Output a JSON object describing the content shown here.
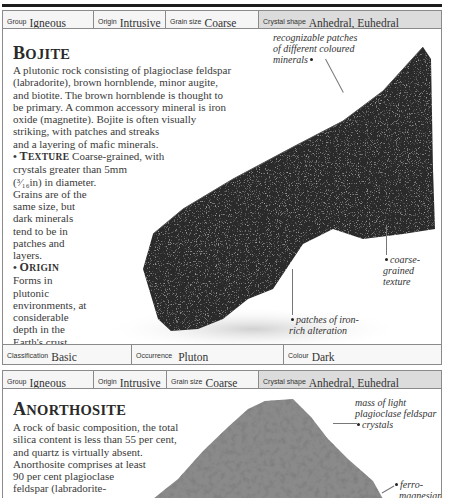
{
  "bojite": {
    "header": {
      "group": {
        "label": "Group",
        "value": "Igneous"
      },
      "origin": {
        "label": "Origin",
        "value": "Intrusive"
      },
      "grain_size": {
        "label": "Grain size",
        "value": "Coarse"
      },
      "crystal_shape": {
        "label": "Crystal shape",
        "value": "Anhedral, Euhedral"
      }
    },
    "title_first": "B",
    "title_rest": "OJITE",
    "description_lines": [
      "A plutonic rock consisting of plagioclase feldspar",
      "(labradorite), brown hornblende, minor augite,",
      "and biotite. The brown hornblende is thought to",
      "be primary. A common accessory mineral is iron",
      "oxide (magnetite). Bojite is often visually",
      "striking, with patches and streaks",
      "and a layering of mafic minerals."
    ],
    "texture": {
      "bullet": "•",
      "heading_first": "T",
      "heading_rest": "EXTURE",
      "lines": [
        "Coarse-grained, with",
        "crystals greater than 5mm",
        "(³⁄₁₆in) in diameter.",
        "Grains are of the",
        "same size, but",
        "dark minerals",
        "tend to be in",
        "patches and",
        "layers."
      ]
    },
    "origin_section": {
      "bullet": "•",
      "heading_first": "O",
      "heading_rest": "RIGIN",
      "lines": [
        "Forms in",
        "plutonic",
        "environments, at",
        "considerable",
        "depth in the",
        "Earth's crust."
      ]
    },
    "annotations": {
      "patches": [
        "recognizable patches",
        "of different coloured",
        "minerals"
      ],
      "coarse": [
        "coarse-grained",
        "texture"
      ],
      "iron": [
        "patches of iron-",
        "rich alteration"
      ]
    },
    "footer": {
      "classification": {
        "label": "Classification",
        "value": "Basic"
      },
      "occurrence": {
        "label": "Occurrence",
        "value": "Pluton"
      },
      "colour": {
        "label": "Colour",
        "value": "Dark"
      }
    }
  },
  "anorthosite": {
    "header": {
      "group": {
        "label": "Group",
        "value": "Igneous"
      },
      "origin": {
        "label": "Origin",
        "value": "Intrusive"
      },
      "grain_size": {
        "label": "Grain size",
        "value": "Coarse"
      },
      "crystal_shape": {
        "label": "Crystal shape",
        "value": "Anhedral, Euhedral"
      }
    },
    "title_first": "A",
    "title_rest": "NORTHOSITE",
    "description_lines": [
      "A rock of basic composition, the total",
      "silica content is less than 55 per cent,",
      "and quartz is virtually absent.",
      "Anorthosite comprises at least",
      "90 per cent plagioclase",
      "feldspar (labradorite-",
      "bytownite). Other"
    ],
    "annotations": {
      "mass": [
        "mass of light",
        "plagioclase feldspar",
        "crystals"
      ],
      "ferro": [
        "ferro-",
        "magnesian"
      ]
    }
  },
  "colors": {
    "rule": "#1c1c1c",
    "header_bg": "#f5f5f5",
    "header_shaded_bg": "#dcdcdc",
    "border": "#8a8a8a",
    "text": "#3a3a3a"
  }
}
